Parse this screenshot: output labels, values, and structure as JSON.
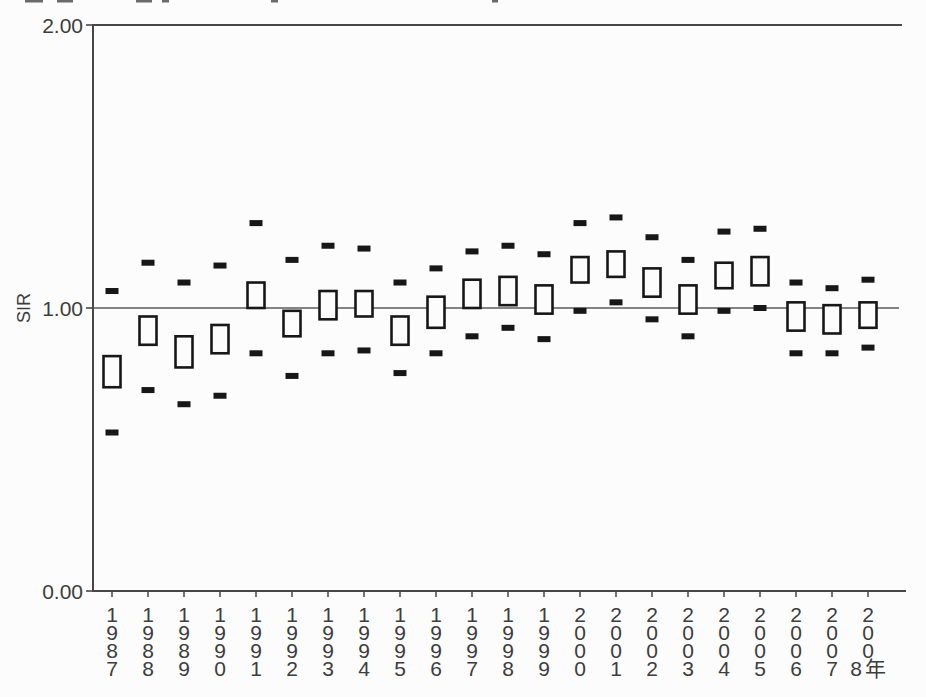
{
  "page": {
    "background": "#fcfcfc"
  },
  "y_axis": {
    "label": "SIR",
    "tick_labels": [
      "2.00",
      "1.00",
      "0.00"
    ],
    "tick_values": [
      2,
      1,
      0
    ]
  },
  "x_axis": {
    "unit_suffix": "年"
  },
  "chart_data": {
    "type": "boxplot",
    "title": "",
    "xlabel": "",
    "ylabel": "SIR",
    "ylim": [
      0,
      2
    ],
    "yticks": [
      0,
      1,
      2
    ],
    "ytick_labels": [
      "0.00",
      "1.00",
      "2.00"
    ],
    "grid": false,
    "legend": false,
    "reference_line": 1.0,
    "x_unit_suffix": "年",
    "categories": [
      "1987",
      "1988",
      "1989",
      "1990",
      "1991",
      "1992",
      "1993",
      "1994",
      "1995",
      "1996",
      "1997",
      "1998",
      "1999",
      "2000",
      "2001",
      "2002",
      "2003",
      "2004",
      "2005",
      "2006",
      "2007",
      "2008"
    ],
    "series": [
      {
        "name": "upper_limit_dash",
        "marker": "filled-dash",
        "values": [
          1.06,
          1.16,
          1.09,
          1.15,
          1.3,
          1.17,
          1.22,
          1.21,
          1.09,
          1.14,
          1.2,
          1.22,
          1.19,
          1.3,
          1.32,
          1.25,
          1.17,
          1.27,
          1.28,
          1.09,
          1.07,
          1.1
        ]
      },
      {
        "name": "box_top",
        "marker": "open-box-top",
        "values": [
          0.83,
          0.97,
          0.9,
          0.94,
          1.09,
          0.99,
          1.06,
          1.06,
          0.97,
          1.04,
          1.1,
          1.11,
          1.08,
          1.18,
          1.2,
          1.14,
          1.08,
          1.16,
          1.18,
          1.02,
          1.01,
          1.02
        ]
      },
      {
        "name": "box_bottom",
        "marker": "open-box-bottom",
        "values": [
          0.72,
          0.87,
          0.79,
          0.84,
          1.0,
          0.9,
          0.96,
          0.97,
          0.87,
          0.93,
          1.0,
          1.01,
          0.98,
          1.09,
          1.11,
          1.04,
          0.98,
          1.07,
          1.08,
          0.92,
          0.91,
          0.93
        ]
      },
      {
        "name": "lower_limit_dash",
        "marker": "filled-dash",
        "values": [
          0.56,
          0.71,
          0.66,
          0.69,
          0.84,
          0.76,
          0.84,
          0.85,
          0.77,
          0.84,
          0.9,
          0.93,
          0.89,
          0.99,
          1.02,
          0.96,
          0.9,
          0.99,
          1.0,
          0.84,
          0.84,
          0.86
        ]
      }
    ],
    "colors": {
      "mark": "#171717",
      "axis": "#474747",
      "text": "#3d3d3d",
      "reference_line": "#5c5c5c",
      "box_fill": "#fcfcfc"
    }
  },
  "artifacts": {
    "top_edge_segments": [
      {
        "x": 25,
        "w": 18
      },
      {
        "x": 57,
        "w": 16
      },
      {
        "x": 136,
        "w": 16
      },
      {
        "x": 162,
        "w": 7
      },
      {
        "x": 271,
        "w": 7
      },
      {
        "x": 492,
        "w": 6
      }
    ]
  }
}
